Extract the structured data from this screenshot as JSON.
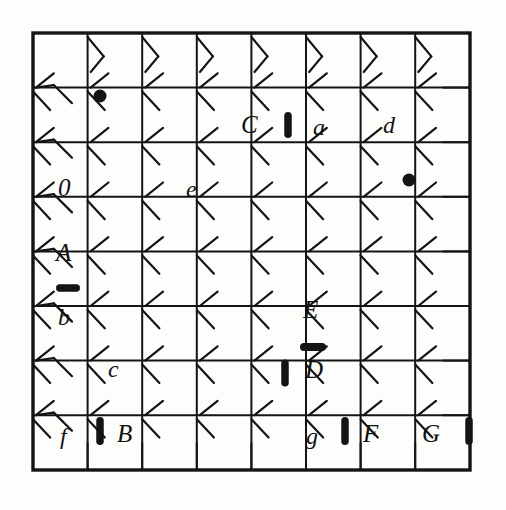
{
  "figure": {
    "kind": "dislocation-network-grid",
    "background_color": "#fdfdfb",
    "ink_color": "#141414",
    "frame": {
      "x": 33,
      "y": 33,
      "width": 437,
      "height": 437,
      "stroke_width": 3.4
    },
    "grid": {
      "columns": 8,
      "rows": 8,
      "cell_size": 54.6,
      "line_stroke_width": 2.0,
      "node_columns": [
        87.6,
        142.2,
        196.8,
        251.4,
        306.0,
        360.6,
        415.2
      ],
      "node_rows": [
        87.6,
        142.2,
        196.8,
        251.4,
        306.0,
        360.6,
        415.2
      ],
      "kink_length": 26,
      "kink_stroke_width": 2.2
    },
    "labels": [
      {
        "text": "C",
        "x": 241,
        "y": 112,
        "style": "upper"
      },
      {
        "text": "a",
        "x": 313,
        "y": 115,
        "style": "lower"
      },
      {
        "text": "d",
        "x": 383,
        "y": 113,
        "style": "lower"
      },
      {
        "text": "0",
        "x": 58,
        "y": 175,
        "style": "digit"
      },
      {
        "text": "e",
        "x": 186,
        "y": 177,
        "style": "lower"
      },
      {
        "text": "A",
        "x": 56,
        "y": 240,
        "style": "upper"
      },
      {
        "text": "b",
        "x": 58,
        "y": 305,
        "style": "lower"
      },
      {
        "text": "E",
        "x": 303,
        "y": 297,
        "style": "upper"
      },
      {
        "text": "c",
        "x": 108,
        "y": 357,
        "style": "lower"
      },
      {
        "text": "D",
        "x": 305,
        "y": 357,
        "style": "upper"
      },
      {
        "text": "f",
        "x": 60,
        "y": 424,
        "style": "lower"
      },
      {
        "text": "B",
        "x": 117,
        "y": 421,
        "style": "upper"
      },
      {
        "text": "g",
        "x": 306,
        "y": 424,
        "style": "lower"
      },
      {
        "text": "F",
        "x": 363,
        "y": 421,
        "style": "upper"
      },
      {
        "text": "G",
        "x": 422,
        "y": 421,
        "style": "upper"
      }
    ],
    "node_markers": [
      {
        "name": "node-dot-upper-left",
        "type": "dot",
        "x": 100,
        "y": 96,
        "radius": 6.5
      },
      {
        "name": "node-dot-near-d",
        "type": "dot",
        "x": 409,
        "y": 180,
        "radius": 6.5
      },
      {
        "name": "bar-a",
        "type": "bar-vertical",
        "x": 288,
        "y": 125,
        "length": 26,
        "thickness": 7.5
      },
      {
        "name": "bar-b",
        "type": "bar-horizontal",
        "x": 68,
        "y": 288,
        "length": 24,
        "thickness": 7.5
      },
      {
        "name": "bar-D-horizontal",
        "type": "bar-horizontal",
        "x": 313,
        "y": 347,
        "length": 26,
        "thickness": 8.0
      },
      {
        "name": "bar-D-vertical",
        "type": "bar-vertical",
        "x": 285,
        "y": 373,
        "length": 27,
        "thickness": 7.5
      },
      {
        "name": "bar-B",
        "type": "bar-vertical",
        "x": 100,
        "y": 431,
        "length": 28,
        "thickness": 7.5
      },
      {
        "name": "bar-F",
        "type": "bar-vertical",
        "x": 345,
        "y": 431,
        "length": 28,
        "thickness": 7.5
      },
      {
        "name": "bar-right-edge",
        "type": "bar-vertical",
        "x": 469,
        "y": 431,
        "length": 28,
        "thickness": 7.5
      }
    ],
    "kink_pattern": {
      "description": "each grid node carries short diagonal segments branching off the orthogonal lines",
      "up_right_diag": true,
      "down_left_diag": true
    }
  }
}
